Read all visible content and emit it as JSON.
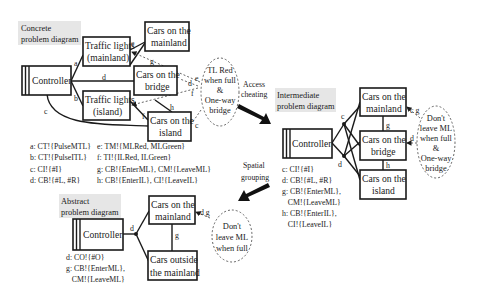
{
  "concrete": {
    "title_line1": "Concrete",
    "title_line2": "problem diagram",
    "controller": "Controller",
    "tl_mainland": [
      "Traffic lights",
      "(mainland)"
    ],
    "tl_island": [
      "Traffic lights",
      "(island)"
    ],
    "cars_mainland": [
      "Cars on the",
      "mainland"
    ],
    "cars_bridge": [
      "Cars on the",
      "bridge"
    ],
    "cars_island": [
      "Cars on the",
      "island"
    ],
    "requirement": [
      "TL Red",
      "when full",
      "&",
      "One-way",
      "bridge"
    ],
    "edge_labels": {
      "a": "a",
      "b": "b",
      "c": "c",
      "d": "d",
      "e": "e",
      "f": "f",
      "g": "g",
      "h": "h"
    },
    "legend": [
      {
        "left": "a: CT!{PulseMTL}",
        "right": "e: TM!{MLRed, MLGreen}"
      },
      {
        "left": "b: CT!{PulseITL}",
        "right": "f: TI!{ILRed, ILGreen}"
      },
      {
        "left": "c: CI!{#I}",
        "right": "g: CB!{EnterML}, CM!{LeaveML}"
      },
      {
        "left": "d: CB!{#L, #R}",
        "right": "h: CB!{EnterIL}, CI!{LeaveIL}"
      }
    ]
  },
  "transitions": {
    "access_cheating": [
      "Access",
      "cheating"
    ],
    "spatial_grouping": [
      "Spatial",
      "grouping"
    ]
  },
  "intermediate": {
    "title_line1": "Intermediate",
    "title_line2": "problem diagram",
    "controller": "Controller",
    "cars_mainland": [
      "Cars on the",
      "mainland"
    ],
    "cars_bridge": [
      "Cars on the",
      "bridge"
    ],
    "cars_island": [
      "Cars on the",
      "island"
    ],
    "requirement": [
      "Don't",
      "leave ML",
      "when full",
      "&",
      "One-way",
      "bridge"
    ],
    "edge_labels": {
      "c": "c",
      "d": "d",
      "g": "g",
      "h": "h",
      "cg": "c g",
      "d2": "d"
    },
    "legend": [
      "c: CI!{#I}",
      "d: CB!{#L, #R}",
      "g: CB!{EnterML},",
      "   CM!{LeaveML}",
      "h: CB!{EnterIL},",
      "   CI!{LeaveIL}"
    ]
  },
  "abstract": {
    "title_line1": "Abstract",
    "title_line2": "problem diagram",
    "controller": "Controller",
    "cars_mainland": [
      "Cars on the",
      "mainland"
    ],
    "cars_outside": [
      "Cars outside",
      "the mainland"
    ],
    "requirement": [
      "Don't",
      "leave ML",
      "when full"
    ],
    "edge_labels": {
      "d": "d",
      "g": "g",
      "dg": "d g"
    },
    "legend": [
      "d: CO!{#O}",
      "g: CB!{EnterML},",
      "   CM!{LeaveML}"
    ]
  }
}
